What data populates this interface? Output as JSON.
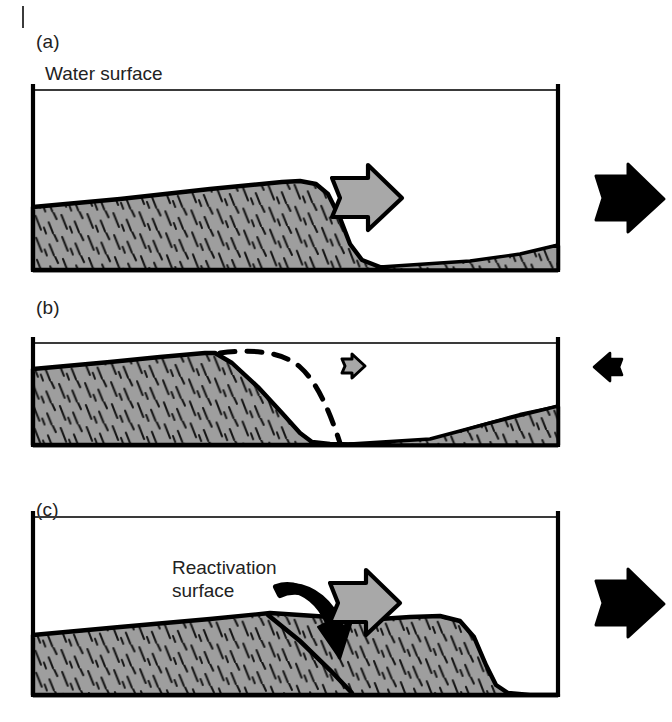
{
  "figure": {
    "type": "sedimentary-structure-diagram",
    "panels": [
      {
        "id": "a",
        "label": "(a)",
        "caption_text": "Water surface",
        "stage": "dominant-flow",
        "flow_arrow_direction": "right",
        "flow_arrow_color": "#a8a8a8",
        "bed_shear_arrow_direction": "right",
        "bed_shear_arrow_color": "#000000",
        "bed_shear_arrow_size": "large",
        "description": "Asymmetric dune with gentle stoss slope and steep lee slope migrating to the right"
      },
      {
        "id": "b",
        "label": "(b)",
        "stage": "subordinate-reversed-flow",
        "flow_arrow_direction": "right",
        "flow_arrow_color": "#a8a8a8",
        "flow_arrow_size": "small",
        "bed_shear_arrow_direction": "left",
        "bed_shear_arrow_color": "#000000",
        "bed_shear_arrow_size": "small",
        "dashed_profile_label": "former dune profile",
        "description": "Dune crest eroded and rounded during weakened or reversed flow; dashed line marks the previous profile"
      },
      {
        "id": "c",
        "label": "(c)",
        "annotation": "Reactivation\nsurface",
        "annotation_line_1": "Reactivation",
        "annotation_line_2": "surface",
        "stage": "renewed-dominant-flow",
        "flow_arrow_direction": "right",
        "flow_arrow_color": "#a8a8a8",
        "bed_shear_arrow_direction": "right",
        "bed_shear_arrow_color": "#000000",
        "bed_shear_arrow_size": "large",
        "pointer_arrow": "curved-down",
        "description": "Renewed dune growth buries the eroded surface, preserved internally as a reactivation surface"
      }
    ],
    "colors": {
      "sediment_fill": "#9e9e9e",
      "sediment_hatch": "#141414",
      "outline": "#000000",
      "flow_arrow": "#a8a8a8",
      "bed_arrow": "#000000",
      "water_line": "#3a3a3a",
      "background": "#ffffff"
    }
  }
}
